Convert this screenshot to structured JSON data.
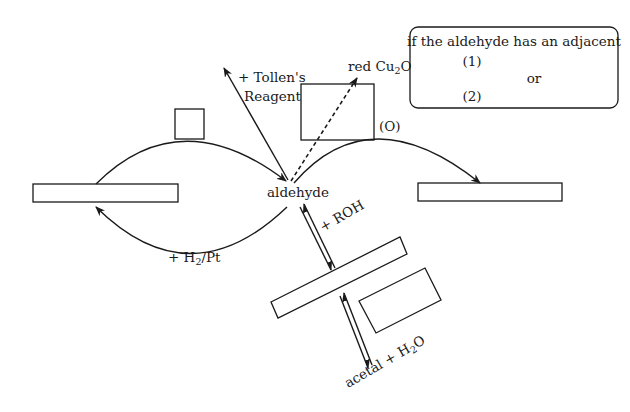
{
  "diagram": {
    "center_label": "aldehyde",
    "reagents": {
      "tollens_line1": "+ Tollen's",
      "tollens_line2": "Reagent",
      "red_prefix": "red Cu",
      "red_sub": "2",
      "red_suffix": "O",
      "oxidation": "(O)",
      "roh": "+ ROH",
      "h2pt_prefix": "+ H",
      "h2pt_sub": "2",
      "h2pt_suffix": "/Pt",
      "acetal_prefix": "acetal + H",
      "acetal_sub": "2",
      "acetal_suffix": "O"
    },
    "note_box": {
      "heading": "if the aldehyde has an adjacent",
      "item1": "(1)",
      "or_label": "or",
      "item2": "(2)"
    },
    "blank_boxes": [
      "left-product-box",
      "right-product-box",
      "small-square-box",
      "fehling-box",
      "hemiacetal-box",
      "acetal-side-box"
    ],
    "colors": {
      "stroke": "#1a1a1a",
      "background": "#ffffff"
    }
  }
}
